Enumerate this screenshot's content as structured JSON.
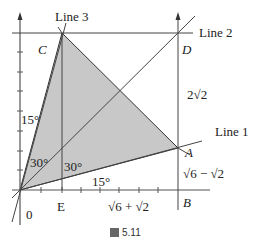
{
  "labels": {
    "line1": "Line 1",
    "line2": "Line 2",
    "line3": "Line 3",
    "C": "C",
    "D": "D",
    "A": "A",
    "B": "B",
    "E": "E",
    "origin": "0",
    "angle_15_left": "15°",
    "angle_30_left": "30°",
    "angle_30_right": "30°",
    "angle_15_bottom": "15°",
    "seg_DA": "2√2",
    "seg_AB": "√6 − √2",
    "seg_EB": "√6 + √2"
  },
  "caption": {
    "text": "5.11"
  },
  "colors": {
    "shade": "#c8c8c8",
    "line": "#333333"
  }
}
